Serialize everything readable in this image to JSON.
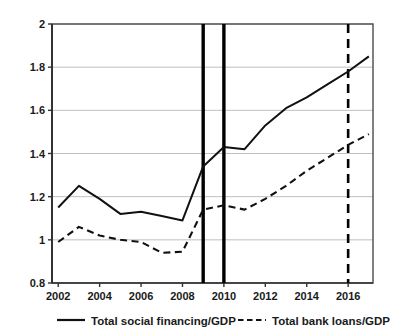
{
  "chart_data": {
    "type": "line",
    "title": "",
    "subtitle": "",
    "xlabel": "",
    "ylabel": "",
    "xlim": [
      2001.7,
      2017.2
    ],
    "ylim": [
      0.8,
      2.0
    ],
    "grid": true,
    "grid_axis": "y",
    "legend_position": "bottom",
    "x": [
      2002,
      2003,
      2004,
      2005,
      2006,
      2007,
      2008,
      2009,
      2010,
      2011,
      2012,
      2013,
      2014,
      2015,
      2016,
      2017
    ],
    "xticks": [
      2002,
      2004,
      2006,
      2008,
      2010,
      2012,
      2014,
      2016
    ],
    "xtick_labels": [
      "2002",
      "2004",
      "2006",
      "2008",
      "2010",
      "2012",
      "2014",
      "2016"
    ],
    "yticks": [
      0.8,
      1.0,
      1.2,
      1.4,
      1.6,
      1.8,
      2.0
    ],
    "ytick_labels": [
      "0.8",
      "1",
      "1.2",
      "1.4",
      "1.6",
      "1.8",
      "2"
    ],
    "series": [
      {
        "name": "Total social financing/GDP",
        "style": "solid",
        "color": "#111111",
        "values": [
          1.15,
          1.25,
          1.19,
          1.12,
          1.13,
          1.11,
          1.09,
          1.34,
          1.43,
          1.42,
          1.53,
          1.61,
          1.66,
          1.72,
          1.78,
          1.85
        ]
      },
      {
        "name": "Total bank loans/GDP",
        "style": "dashed",
        "color": "#111111",
        "values": [
          0.99,
          1.06,
          1.02,
          1.0,
          0.99,
          0.94,
          0.945,
          1.14,
          1.16,
          1.14,
          1.19,
          1.25,
          1.32,
          1.38,
          1.44,
          1.49
        ]
      }
    ],
    "vlines": [
      {
        "x": 2009,
        "style": "solid",
        "width": 3.4,
        "color": "#000000",
        "name": "event-line-2009"
      },
      {
        "x": 2010,
        "style": "solid",
        "width": 3.4,
        "color": "#000000",
        "name": "event-line-2010"
      },
      {
        "x": 2016,
        "style": "dashed",
        "width": 2.6,
        "color": "#000000",
        "name": "event-line-2016"
      }
    ]
  },
  "legend": {
    "items": [
      {
        "label": "Total social financing/GDP",
        "style": "solid"
      },
      {
        "label": "Total bank loans/GDP",
        "style": "dashed"
      }
    ]
  },
  "axes": {
    "y_labels": [
      "2",
      "1.8",
      "1.6",
      "1.4",
      "1.2",
      "1",
      "0.8"
    ],
    "x_labels": [
      "2002",
      "2004",
      "2006",
      "2008",
      "2010",
      "2012",
      "2014",
      "2016"
    ]
  },
  "colors": {
    "line": "#111111",
    "grid": "#b8b8b8",
    "axis": "#4a4a4a",
    "background": "#ffffff"
  }
}
